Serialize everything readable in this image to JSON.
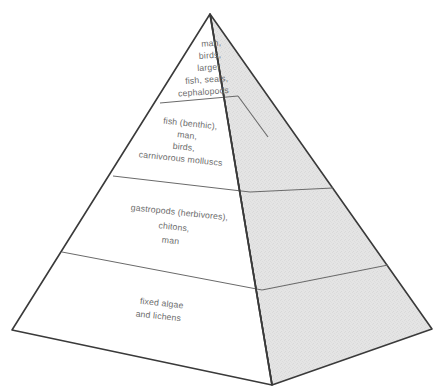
{
  "diagram": {
    "type": "ecological-pyramid",
    "title": "",
    "orientation": "3d-perspective",
    "face_left_fill": "#ffffff",
    "face_right_fill": "#e3e3e3",
    "outline_color": "#3a3a3a",
    "divider_color": "#5a5a5a",
    "text_color": "#6d6d6d",
    "tiers": [
      {
        "index": 0,
        "position": "top",
        "name": "top-tier",
        "lines": [
          "man,",
          "birds,",
          "larger",
          "fish, seals,",
          "cephalopods"
        ]
      },
      {
        "index": 1,
        "position": "upper-middle",
        "name": "second-tier",
        "lines": [
          "fish (benthic),",
          "man,",
          "birds,",
          "carnivorous molluscs"
        ]
      },
      {
        "index": 2,
        "position": "lower-middle",
        "name": "third-tier",
        "lines": [
          "gastropods (herbivores),",
          "chitons,",
          "man"
        ]
      },
      {
        "index": 3,
        "position": "base",
        "name": "base-tier",
        "lines": [
          "fixed algae",
          "and lichens"
        ]
      }
    ]
  }
}
